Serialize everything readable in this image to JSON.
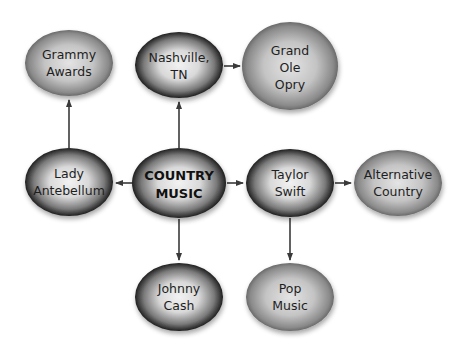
{
  "diagram": {
    "type": "concept-map",
    "colors": {
      "background": "#ffffff",
      "edge": "#3a3a3a",
      "text": "#1e1e1e"
    },
    "nodes": [
      {
        "id": "country",
        "lines": [
          "COUNTRY",
          "MUSIC"
        ],
        "style": "dark",
        "center": true
      },
      {
        "id": "grammy",
        "lines": [
          "Grammy",
          "Awards"
        ],
        "style": "light"
      },
      {
        "id": "nashville",
        "lines": [
          "Nashville,",
          "TN"
        ],
        "style": "dark"
      },
      {
        "id": "opry",
        "lines": [
          "Grand",
          "Ole",
          "Opry"
        ],
        "style": "light"
      },
      {
        "id": "lady",
        "lines": [
          "Lady",
          "Antebellum"
        ],
        "style": "dark"
      },
      {
        "id": "taylor",
        "lines": [
          "Taylor",
          "Swift"
        ],
        "style": "dark"
      },
      {
        "id": "alt",
        "lines": [
          "Alternative",
          "Country"
        ],
        "style": "light"
      },
      {
        "id": "johnny",
        "lines": [
          "Johnny",
          "Cash"
        ],
        "style": "dark"
      },
      {
        "id": "pop",
        "lines": [
          "Pop",
          "Music"
        ],
        "style": "light"
      }
    ],
    "edges": [
      {
        "from": "country",
        "to": "nashville"
      },
      {
        "from": "country",
        "to": "lady"
      },
      {
        "from": "country",
        "to": "taylor"
      },
      {
        "from": "country",
        "to": "johnny"
      },
      {
        "from": "lady",
        "to": "grammy"
      },
      {
        "from": "nashville",
        "to": "opry"
      },
      {
        "from": "taylor",
        "to": "alt"
      },
      {
        "from": "taylor",
        "to": "pop"
      }
    ]
  }
}
